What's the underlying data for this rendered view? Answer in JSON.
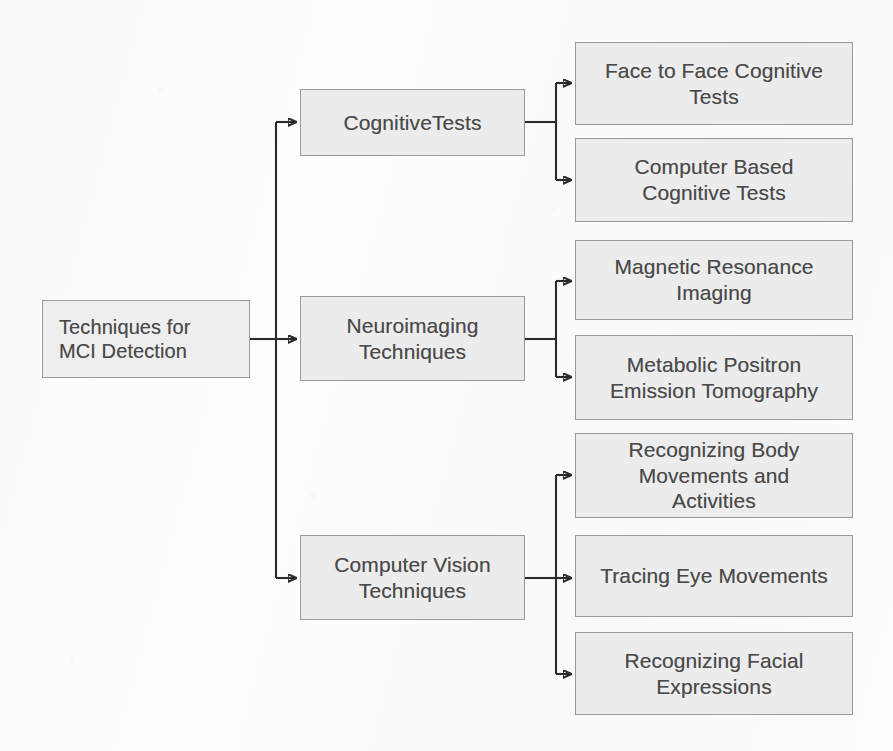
{
  "diagram": {
    "type": "tree-flowchart",
    "orientation": "left-to-right",
    "colors": {
      "node_fill": "#ececec",
      "node_border": "#9a9a9a",
      "text": "#4a4a4a",
      "connector": "#2b2b2b",
      "background": "#fdfdfc"
    },
    "root": {
      "id": "root",
      "label": "Techniques for\nMCI Detection",
      "font_size": "20px"
    },
    "branches": [
      {
        "id": "cognitive-tests",
        "label": "CognitiveTests",
        "font_size": "21px",
        "children": [
          {
            "id": "face-to-face-cognitive-tests",
            "label": "Face to Face Cognitive\nTests",
            "font_size": "21px"
          },
          {
            "id": "computer-based-cognitive-tests",
            "label": "Computer Based\nCognitive Tests",
            "font_size": "21px"
          }
        ]
      },
      {
        "id": "neuroimaging-techniques",
        "label": "Neuroimaging\nTechniques",
        "font_size": "21px",
        "children": [
          {
            "id": "magnetic-resonance-imaging",
            "label": "Magnetic Resonance\nImaging",
            "font_size": "21px"
          },
          {
            "id": "metabolic-positron-emission-tomography",
            "label": "Metabolic Positron\nEmission Tomography",
            "font_size": "21px"
          }
        ]
      },
      {
        "id": "computer-vision-techniques",
        "label": "Computer Vision\nTechniques",
        "font_size": "21px",
        "children": [
          {
            "id": "recognizing-body-movements-and-activities",
            "label": "Recognizing Body\nMovements and\nActivities",
            "font_size": "21px"
          },
          {
            "id": "tracing-eye-movements",
            "label": "Tracing Eye Movements",
            "font_size": "21px"
          },
          {
            "id": "recognizing-facial-expressions",
            "label": "Recognizing Facial\nExpressions",
            "font_size": "21px"
          }
        ]
      }
    ]
  }
}
